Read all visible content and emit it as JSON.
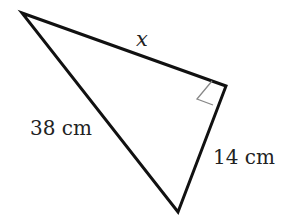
{
  "diagram": {
    "type": "right-triangle",
    "vertices": {
      "top_left": [
        22,
        13
      ],
      "right_angle": [
        226,
        86
      ],
      "bottom": [
        178,
        212
      ]
    },
    "labels": {
      "top_side": "x",
      "hypotenuse": "38 cm",
      "short_side": "14 cm"
    },
    "right_angle_marker": true,
    "colors": {
      "stroke": "#111111",
      "marker": "#888888",
      "text": "#222222"
    }
  }
}
